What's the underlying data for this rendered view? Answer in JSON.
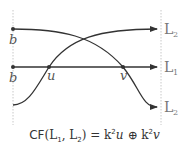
{
  "diagram": {
    "left_point_labels": [
      "b",
      "b"
    ],
    "intersection_labels": [
      "u",
      "v"
    ],
    "right_labels": [
      {
        "name": "L",
        "sub": "2"
      },
      {
        "name": "L",
        "sub": "1"
      },
      {
        "name": "L",
        "sub": "2"
      }
    ],
    "colors": {
      "line": "#333333",
      "guide": "#c8c8c8",
      "label": "#777777"
    }
  },
  "formula": {
    "prefix": "CF",
    "open": "(",
    "arg1": "L",
    "arg1_sub": "1",
    "comma": ", ",
    "arg2": "L",
    "arg2_sub": "2",
    "close": ")",
    "equals": " = ",
    "term1_coef": "k",
    "term1_pow": "2",
    "term1_var": "u",
    "op": " ⊕ ",
    "term2_coef": "k",
    "term2_pow": "2",
    "term2_var": "v"
  }
}
